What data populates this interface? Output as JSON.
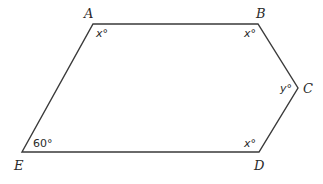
{
  "figure": {
    "type": "pentagon",
    "vertices": [
      {
        "name": "A",
        "label": "A",
        "x": 93,
        "y": 24
      },
      {
        "name": "B",
        "label": "B",
        "x": 258,
        "y": 24
      },
      {
        "name": "C",
        "label": "C",
        "x": 298,
        "y": 88
      },
      {
        "name": "D",
        "label": "D",
        "x": 259,
        "y": 152
      },
      {
        "name": "E",
        "label": "E",
        "x": 22,
        "y": 152
      }
    ],
    "angles": {
      "A": "x°",
      "B": "x°",
      "C": "y°",
      "D": "x°",
      "E": "60°"
    },
    "stroke_color": "#3a3a3a",
    "background": "#ffffff"
  }
}
